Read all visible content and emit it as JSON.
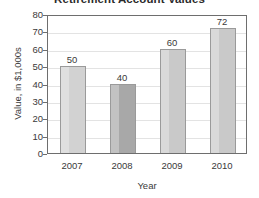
{
  "chart_data": {
    "type": "bar",
    "title": "Retirement Account Values",
    "xlabel": "Year",
    "ylabel": "Value, in $1,000s",
    "categories": [
      "2007",
      "2008",
      "2009",
      "2010"
    ],
    "values": [
      50,
      40,
      60,
      72
    ],
    "value_labels": [
      "50",
      "40",
      "60",
      "72"
    ],
    "ylim": [
      0,
      80
    ],
    "yticks": [
      80,
      70,
      60,
      50,
      40,
      30,
      20,
      10,
      0
    ],
    "ytick_labels": [
      "80",
      "70",
      "60",
      "50",
      "40",
      "30",
      "20",
      "10",
      "0"
    ],
    "grid": true,
    "legend": "none",
    "bar_colors": [
      "#d2d2d2",
      "#a8a8a8",
      "#c9c9c9",
      "#c9c9c9"
    ],
    "bar_border_color": "#9a9a9a",
    "axis_color": "#6e6e6e",
    "grid_color": "#e3e3e3",
    "background": "#ffffff",
    "text_color": "#3a3a3a"
  }
}
